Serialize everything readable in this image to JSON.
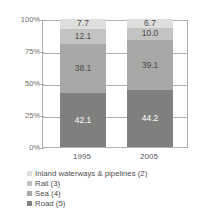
{
  "chart_data": {
    "type": "bar",
    "variant": "stacked-100-percent",
    "title": "",
    "xlabel": "",
    "ylabel": "",
    "categories": [
      "1995",
      "2005"
    ],
    "ylim": [
      0,
      100
    ],
    "ytick_labels": [
      "100%",
      "75%",
      "50%",
      "25%",
      "0%"
    ],
    "ytick_values": [
      100,
      75,
      50,
      25,
      0
    ],
    "grid": true,
    "legend_position": "bottom-left",
    "stack_order_bottom_to_top": [
      "Road (5)",
      "Sea (4)",
      "Rail (3)",
      "Inland waterways & pipelines (2)"
    ],
    "series": [
      {
        "name": "Inland waterways & pipelines (2)",
        "color": "#dededd",
        "values": [
          7.7,
          6.7
        ],
        "labels": [
          "7.7",
          "6.7"
        ]
      },
      {
        "name": "Rail (3)",
        "color": "#c3c3c2",
        "values": [
          12.1,
          10.0
        ],
        "labels": [
          "12.1",
          "10.0"
        ]
      },
      {
        "name": "Sea (4)",
        "color": "#a8a8a7",
        "values": [
          38.1,
          39.1
        ],
        "labels": [
          "38.1",
          "39.1"
        ]
      },
      {
        "name": "Road (5)",
        "color": "#7f7f7e",
        "values": [
          42.1,
          44.2
        ],
        "labels": [
          "42.1",
          "44.2"
        ]
      }
    ]
  },
  "axis": {
    "ticks": [
      {
        "label": "100%",
        "value": 100
      },
      {
        "label": "75%",
        "value": 75
      },
      {
        "label": "50%",
        "value": 50
      },
      {
        "label": "25%",
        "value": 25
      },
      {
        "label": "0%",
        "value": 0
      }
    ]
  },
  "xaxis": {
    "labels": [
      "1995",
      "2005"
    ]
  },
  "legend": {
    "items": [
      {
        "label": "Inland waterways & pipelines (2)",
        "color": "#dededd"
      },
      {
        "label": "Rail (3)",
        "color": "#c3c3c2"
      },
      {
        "label": "Sea (4)",
        "color": "#a8a8a7"
      },
      {
        "label": "Road (5)",
        "color": "#7f7f7e"
      }
    ]
  },
  "colors": {
    "grid": "#b0b0b0",
    "tick_text": "#6d6d6d",
    "label_text": "#4a4a4a",
    "label_text_on_dark": "#ffffff",
    "background": "#ffffff"
  }
}
